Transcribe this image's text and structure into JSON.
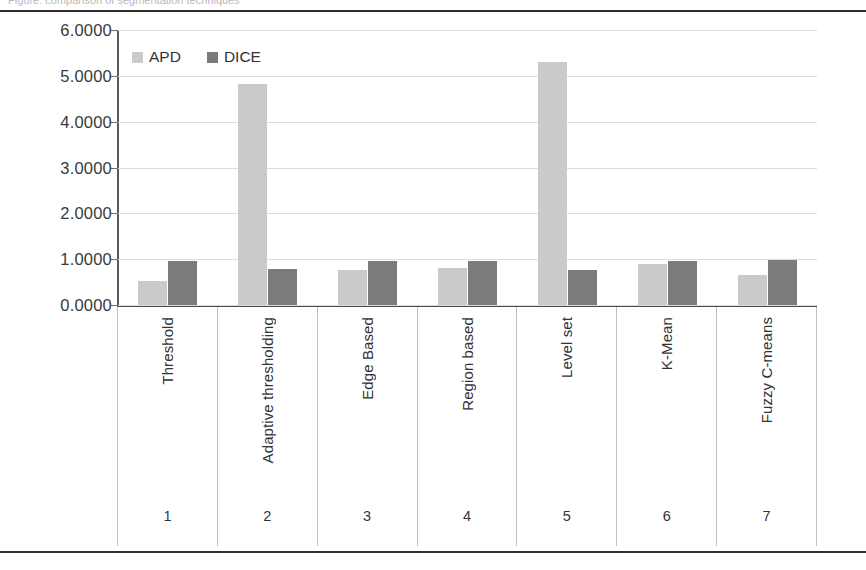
{
  "page": {
    "top_cut_text": "Figure: comparison of segmentation techniques"
  },
  "chart_data": {
    "type": "bar",
    "title": "",
    "xlabel": "",
    "ylabel": "",
    "ylim": [
      0,
      6
    ],
    "grid": true,
    "legend_position": "top-left",
    "categories": [
      "Threshold",
      "Adaptive thresholding",
      "Edge Based",
      "Region based",
      "Level set",
      "K-Mean",
      "Fuzzy C-means"
    ],
    "category_indices": [
      "1",
      "2",
      "3",
      "4",
      "5",
      "6",
      "7"
    ],
    "ytick_labels": [
      "6.0000",
      "5.0000",
      "4.0000",
      "3.0000",
      "2.0000",
      "1.0000",
      "0.0000"
    ],
    "ytick_values": [
      6,
      5,
      4,
      3,
      2,
      1,
      0
    ],
    "series": [
      {
        "name": "APD",
        "color": "#cacaca",
        "values": [
          0.52,
          4.82,
          0.77,
          0.8,
          5.3,
          0.9,
          0.65
        ]
      },
      {
        "name": "DICE",
        "color": "#7b7b7b",
        "values": [
          0.96,
          0.79,
          0.95,
          0.95,
          0.77,
          0.97,
          0.99
        ]
      }
    ]
  }
}
